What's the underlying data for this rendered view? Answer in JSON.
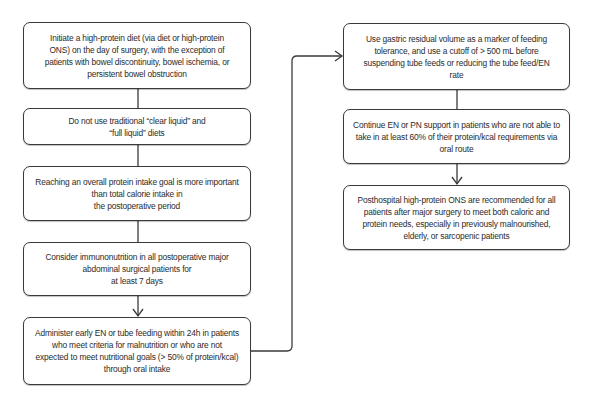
{
  "flowchart": {
    "left_column": [
      {
        "id": "initiate-high-protein",
        "text": "Initiate a high-protein diet (via diet or high-protein\nONS) on the day of surgery, with the exception of\npatients with bowel discontinuity, bowel ischemia, or\npersistent bowel obstruction"
      },
      {
        "id": "no-clear-liquid",
        "text": "Do not use traditional “clear liquid” and\n“full liquid” diets"
      },
      {
        "id": "protein-goal",
        "text": "Reaching an overall protein intake goal is more important\nthan total calorie intake in\nthe postoperative period"
      },
      {
        "id": "immunonutrition",
        "text": "Consider immunonutrition in all postoperative major\nabdominal surgical patients for\nat least 7 days"
      },
      {
        "id": "early-en",
        "text": "Administer early EN or tube feeding within 24h in patients\nwho meet criteria for malnutrition or who are not\nexpected to meet nutritional goals (> 50% of protein/kcal)\nthrough oral intake"
      }
    ],
    "right_column": [
      {
        "id": "gastric-residual",
        "text": "Use gastric residual volume as a marker of feeding\ntolerance, and use a cutoff of > 500 mL before\nsuspending tube feeds or reducing the tube feed/EN\nrate"
      },
      {
        "id": "continue-en-pn",
        "text": "Continue EN or PN support in patients who are not able to\ntake in at least 60% of their protein/kcal requirements via\noral route"
      },
      {
        "id": "posthospital-ons",
        "text": "Posthospital high-protein ONS are recommended for all\npatients after major surgery to meet both caloric and\nprotein needs, especially in previously malnourished,\nelderly, or sarcopenic patients"
      }
    ]
  },
  "colors": {
    "line": "#3a3a3a",
    "text": "#2b2b2b",
    "background": "#ffffff"
  }
}
